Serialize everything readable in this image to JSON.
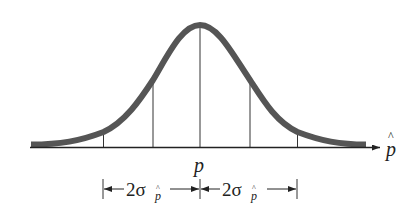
{
  "diagram": {
    "type": "normal-distribution-sampling",
    "colors": {
      "curve": "#555555",
      "lines": "#222222",
      "text": "#222222",
      "background": "#ffffff"
    },
    "axis_label": "p̂",
    "center_label": "p",
    "interval_labels": [
      {
        "coef": "2σ",
        "sub": "p̂"
      },
      {
        "coef": "2σ",
        "sub": "p̂"
      }
    ],
    "vertical_lines": [
      {
        "name": "minus-2sigma-line"
      },
      {
        "name": "minus-1sigma-line"
      },
      {
        "name": "mean-line"
      },
      {
        "name": "plus-1sigma-line"
      },
      {
        "name": "plus-2sigma-line"
      }
    ]
  }
}
